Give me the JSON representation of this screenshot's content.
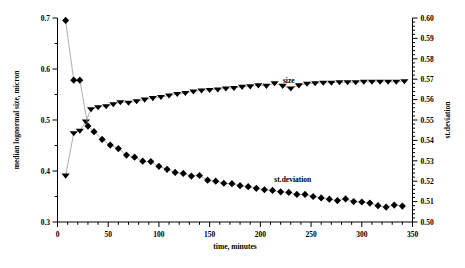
{
  "chart_data": {
    "type": "scatter",
    "title": "",
    "xlabel": "time, minutes",
    "ylabel": "median lognormal size, micron",
    "y2label": "st.deviation",
    "xlim": [
      0,
      350
    ],
    "ylim": [
      0.3,
      0.7
    ],
    "y2lim": [
      0.5,
      0.6
    ],
    "xticks": [
      0,
      50,
      100,
      150,
      200,
      250,
      300,
      350
    ],
    "xticklabels": [
      "0",
      "50",
      "100",
      "150",
      "200",
      "250",
      "300",
      "350"
    ],
    "yticks": [
      0.3,
      0.4,
      0.5,
      0.6,
      0.7
    ],
    "yticklabels": [
      "0.3",
      "0.4",
      "0.5",
      "0.6",
      "0.7"
    ],
    "y2ticks": [
      0.5,
      0.51,
      0.52,
      0.53,
      0.54,
      0.55,
      0.56,
      0.57,
      0.58,
      0.59,
      0.6
    ],
    "y2ticklabels": [
      "0.50",
      "0.51",
      "0.52",
      "0.53",
      "0.54",
      "0.55",
      "0.56",
      "0.57",
      "0.58",
      "0.59",
      "0.60"
    ],
    "x_minor_step": 10,
    "y_minor_step": 0.05,
    "grid": false,
    "legend_position": "inline-annotations",
    "series": [
      {
        "name": "size",
        "label": "size",
        "axis": "left",
        "marker": "triangle-down",
        "color": "#000000",
        "line_color": "#999999",
        "annotation": {
          "text": "size",
          "x": 228,
          "y": 0.572
        },
        "x": [
          8,
          16,
          22,
          28,
          33,
          40,
          48,
          55,
          62,
          70,
          78,
          86,
          94,
          102,
          110,
          118,
          126,
          134,
          142,
          150,
          158,
          166,
          174,
          182,
          190,
          198,
          206,
          214,
          222,
          230,
          238,
          246,
          254,
          262,
          270,
          278,
          286,
          294,
          302,
          310,
          318,
          326,
          334,
          342
        ],
        "y": [
          0.391,
          0.474,
          0.479,
          0.497,
          0.521,
          0.525,
          0.527,
          0.531,
          0.535,
          0.534,
          0.537,
          0.54,
          0.543,
          0.545,
          0.548,
          0.551,
          0.553,
          0.556,
          0.558,
          0.559,
          0.56,
          0.562,
          0.563,
          0.565,
          0.566,
          0.568,
          0.567,
          0.572,
          0.567,
          0.562,
          0.568,
          0.571,
          0.572,
          0.573,
          0.573,
          0.574,
          0.574,
          0.574,
          0.575,
          0.575,
          0.575,
          0.575,
          0.575,
          0.576
        ]
      },
      {
        "name": "st.deviation",
        "label": "st.deviation",
        "axis": "right",
        "marker": "diamond",
        "color": "#000000",
        "line_color": "#999999",
        "annotation": {
          "text": "st.deviation",
          "x": 232,
          "y": 0.5195
        },
        "x": [
          8,
          16,
          22,
          30,
          36,
          44,
          52,
          60,
          68,
          76,
          84,
          92,
          100,
          108,
          116,
          124,
          132,
          140,
          148,
          156,
          164,
          172,
          180,
          188,
          196,
          204,
          212,
          220,
          228,
          236,
          244,
          252,
          260,
          268,
          276,
          284,
          292,
          300,
          308,
          316,
          324,
          332,
          340
        ],
        "y": [
          0.5988,
          0.5695,
          0.5695,
          0.547,
          0.5443,
          0.5405,
          0.5377,
          0.536,
          0.5328,
          0.5318,
          0.5298,
          0.5296,
          0.5273,
          0.5258,
          0.5243,
          0.5238,
          0.5225,
          0.5228,
          0.5205,
          0.52,
          0.519,
          0.5188,
          0.5178,
          0.5173,
          0.5165,
          0.5158,
          0.5155,
          0.5148,
          0.5145,
          0.5135,
          0.5135,
          0.5125,
          0.5118,
          0.5112,
          0.5105,
          0.5113,
          0.51,
          0.5098,
          0.5093,
          0.508,
          0.5073,
          0.5083,
          0.5078
        ]
      }
    ]
  },
  "plot": {
    "background_color": "#ffffff",
    "axis_color": "#000000",
    "marker_color": "#000000",
    "connector_color": "#9a9a9a"
  }
}
